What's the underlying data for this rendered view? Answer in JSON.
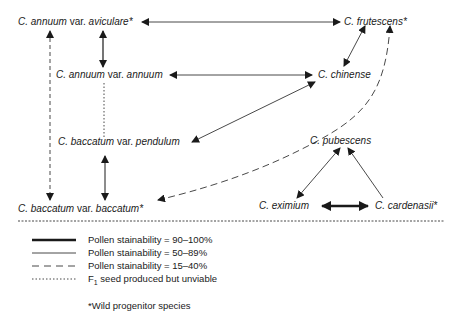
{
  "nodes": {
    "aviculare": {
      "genus": "C. annuum",
      "var": " var. ",
      "name": "aviculare*"
    },
    "annuum": {
      "genus": "C. annuum",
      "var": " var. ",
      "name": "annuum"
    },
    "pendulum": {
      "genus": "C. baccatum",
      "var": " var. ",
      "name": "pendulum"
    },
    "baccatum": {
      "genus": "C. baccatum",
      "var": " var. ",
      "name": "baccatum*"
    },
    "frutescens": {
      "label": "C. frutescens*"
    },
    "chinense": {
      "label": "C. chinense"
    },
    "pubescens": {
      "label": "C. pubescens"
    },
    "eximium": {
      "label": "C. eximium"
    },
    "cardenasii": {
      "label": "C. cardenasii*"
    }
  },
  "legend": {
    "items": [
      {
        "style": "thick",
        "label": "Pollen stainability = 90–100%"
      },
      {
        "style": "thin",
        "label": "Pollen stainability = 50–89%"
      },
      {
        "style": "dashed",
        "label": "Pollen stainability = 15–40%"
      },
      {
        "style": "dotted",
        "label_prefix": "F",
        "label_sub": "1",
        "label_suffix": " seed produced but unviable"
      }
    ],
    "footnote": "*Wild progenitor species"
  },
  "colors": {
    "line": "#1a1a1a",
    "background": "#ffffff"
  }
}
